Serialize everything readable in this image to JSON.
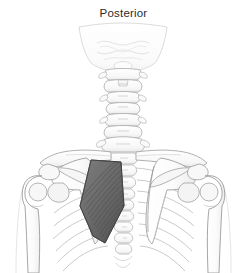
{
  "figure": {
    "title": "Posterior",
    "title_position": "top-center",
    "background_color": "#ffffff",
    "width": 247,
    "height": 273
  },
  "palette": {
    "background": "#ffffff",
    "bone_fill": "#fbfbfb",
    "bone_fill_shade": "#f0f0f0",
    "bone_outline": "#9a9a9a",
    "bone_outline_soft": "#b9b9b9",
    "rib_outline": "#bcbcbc",
    "skull_fill": "#fdfdfd",
    "skull_outline": "#d8d8d8",
    "highlight_muscle_fill": "#6e6e6e",
    "highlight_muscle_fill_dark": "#5a5a5a",
    "highlight_muscle_fiber": "#4f4f4f",
    "highlight_muscle_outline": "#4a4a4a",
    "soft_tissue_outline": "#cfcfcf",
    "title_color": "#2b2b2b"
  },
  "structures": {
    "occipital_bone": {
      "label": "occipital-bone",
      "shade": "#fdfdfd"
    },
    "cervical_spine": {
      "label": "cervical-vertebrae",
      "count": 7
    },
    "thoracic_spine": {
      "label": "thoracic-vertebrae",
      "count": 8
    },
    "clavicle_left": {
      "label": "clavicle-left"
    },
    "clavicle_right": {
      "label": "clavicle-right"
    },
    "scapula_left": {
      "label": "scapula-left"
    },
    "scapula_right": {
      "label": "scapula-right"
    },
    "humerus_left": {
      "label": "humerus-left"
    },
    "humerus_right": {
      "label": "humerus-right"
    },
    "ribcage": {
      "label": "rib-cage",
      "rib_pairs": 9
    },
    "highlighted_muscle": {
      "label": "rhomboid-major-left",
      "state": "highlighted",
      "fill": "#6e6e6e",
      "fiber_direction": "inferolateral",
      "fiber_count": 16
    }
  }
}
